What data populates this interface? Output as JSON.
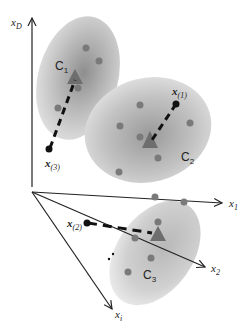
{
  "diagram": {
    "type": "cluster-assignment-illustration",
    "axes": {
      "vertical": {
        "label": "x",
        "subscript": "D"
      },
      "axis1": {
        "label": "x",
        "subscript": "1"
      },
      "axis2": {
        "label": "x",
        "subscript": "2"
      },
      "axis3": {
        "label": "x",
        "subscript": "i"
      }
    },
    "clusters": [
      {
        "label": "C",
        "subscript": "1",
        "color": "#b3b3b3"
      },
      {
        "label": "C",
        "subscript": "2",
        "color": "#b3b3b3"
      },
      {
        "label": "C",
        "subscript": "3",
        "color": "#c8c8c8"
      }
    ],
    "points": [
      {
        "label": "x",
        "subscript": "(1)",
        "assigned_to": "C2"
      },
      {
        "label": "x",
        "subscript": "(2)",
        "assigned_to": "C3"
      },
      {
        "label": "x",
        "subscript": "(3)",
        "assigned_to": "C1"
      }
    ],
    "colors": {
      "point_dots": "#7a7a7a",
      "centroid_triangle": "#6e6e6e",
      "axes": "#222222",
      "dashed_link": "#111111"
    }
  }
}
